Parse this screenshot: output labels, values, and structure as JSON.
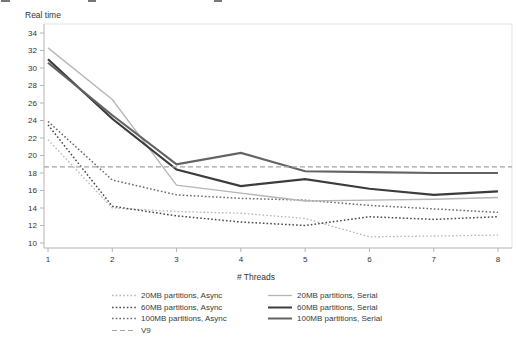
{
  "chart_data": {
    "type": "line",
    "title": "",
    "ylabel": "Real time",
    "xlabel": "# Threads",
    "x": [
      1,
      2,
      3,
      4,
      5,
      6,
      7,
      8
    ],
    "ylim": [
      10,
      34
    ],
    "ytick_step": 2,
    "grid": false,
    "legend_position": "bottom",
    "series": [
      {
        "name": "20MB partitions, Async",
        "style": "dotted",
        "color": "#b6b6b6",
        "width": 1.3,
        "values": [
          21.8,
          14.0,
          13.6,
          13.4,
          12.8,
          10.7,
          10.8,
          10.9
        ]
      },
      {
        "name": "60MB partitions, Async",
        "style": "dotted",
        "color": "#4a4a4a",
        "width": 1.5,
        "values": [
          23.5,
          14.2,
          13.1,
          12.4,
          12.0,
          13.0,
          12.7,
          13.0
        ]
      },
      {
        "name": "100MB partitions, Async",
        "style": "dotted",
        "color": "#6b6b6b",
        "width": 1.5,
        "values": [
          23.9,
          17.2,
          15.5,
          15.1,
          14.9,
          14.3,
          13.9,
          13.5
        ]
      },
      {
        "name": "20MB partitions, Serial",
        "style": "solid",
        "color": "#b6b6b6",
        "width": 1.3,
        "values": [
          32.3,
          26.4,
          16.6,
          15.7,
          14.8,
          14.9,
          15.0,
          15.2
        ]
      },
      {
        "name": "60MB partitions, Serial",
        "style": "solid",
        "color": "#3c3c3c",
        "width": 2.2,
        "values": [
          31.0,
          24.2,
          18.4,
          16.5,
          17.3,
          16.2,
          15.5,
          15.9
        ]
      },
      {
        "name": "100MB partitions, Serial",
        "style": "solid",
        "color": "#636363",
        "width": 2.2,
        "values": [
          30.6,
          24.6,
          19.0,
          20.3,
          18.2,
          18.1,
          18.0,
          18.0
        ]
      },
      {
        "name": "V9",
        "style": "dashed",
        "color": "#a6a69c",
        "width": 1.2,
        "hline": 18.7
      }
    ],
    "legend_columns": [
      [
        "20MB partitions, Async",
        "60MB partitions, Async",
        "100MB partitions, Async",
        "V9"
      ],
      [
        "20MB partitions, Serial",
        "60MB partitions, Serial",
        "100MB partitions, Serial"
      ]
    ]
  },
  "top_artifact_marks": [
    {
      "x": 1,
      "w": 9
    },
    {
      "x": 88,
      "w": 8
    },
    {
      "x": 214,
      "w": 8
    }
  ]
}
